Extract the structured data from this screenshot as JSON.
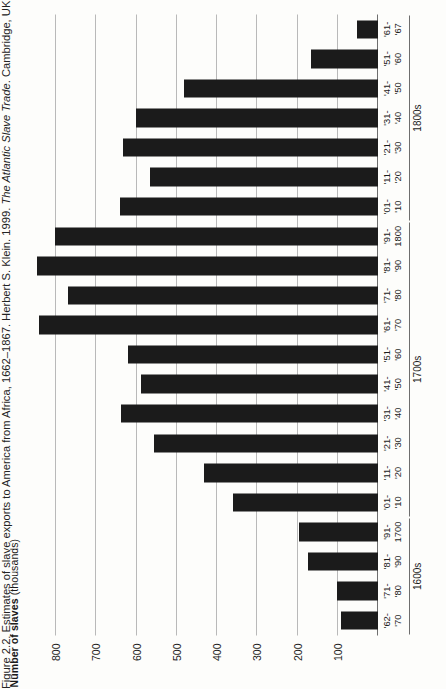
{
  "figure": {
    "caption_prefix": "Figure 2.2. Estimates of slave exports to America from Africa, 1662–1867. Herbert S. Klein. 1999. ",
    "caption_italic": "The Atlantic Slave Trade",
    "caption_suffix": ". Cambridge, UK:"
  },
  "axis_title": {
    "bold": "Number of slaves",
    "light": " (thousands)"
  },
  "groups": [
    {
      "label": "1600s",
      "start_index": 0,
      "end_index": 3
    },
    {
      "label": "1700s",
      "start_index": 4,
      "end_index": 13
    },
    {
      "label": "1800s",
      "start_index": 14,
      "end_index": 20
    }
  ],
  "chart_data": {
    "type": "bar",
    "orientation": "vertical-printed-rotated-90",
    "title": "",
    "xlabel": "",
    "ylabel": "Number of slaves (thousands)",
    "ylim": [
      0,
      850
    ],
    "yticks": [
      100,
      200,
      300,
      400,
      500,
      600,
      700,
      800
    ],
    "ytick_labels": [
      "100",
      "200",
      "300",
      "400",
      "500",
      "600",
      "700",
      "800"
    ],
    "grid": true,
    "legend": null,
    "bar_color": "#1b1b1b",
    "categories": [
      "'62-\n'70",
      "'71-\n'80",
      "'81-\n'90",
      "'91- 1700",
      "'01-\n'10",
      "'11-\n'20",
      "'21-\n'30",
      "'31-\n'40",
      "'41-\n'50",
      "'51-\n'60",
      "'61-\n'70",
      "'71-\n'80",
      "'81-\n'90",
      "'91- 1800",
      "'01-\n'10",
      "'11-\n'20",
      "'21-\n'30",
      "'31-\n'40",
      "'41-\n'50",
      "'51-\n'60",
      "'61-\n'67"
    ],
    "category_lines": [
      [
        "'62-",
        "'70"
      ],
      [
        "'71-",
        "'80"
      ],
      [
        "'81-",
        "'90"
      ],
      [
        "'91-",
        "1700"
      ],
      [
        "'01-",
        "'10"
      ],
      [
        "'11-",
        "'20"
      ],
      [
        "'21-",
        "'30"
      ],
      [
        "'31-",
        "'40"
      ],
      [
        "'41-",
        "'50"
      ],
      [
        "'51-",
        "'60"
      ],
      [
        "'61-",
        "'70"
      ],
      [
        "'71-",
        "'80"
      ],
      [
        "'81-",
        "'90"
      ],
      [
        "'91-",
        "1800"
      ],
      [
        "'01-",
        "'10"
      ],
      [
        "'11-",
        "'20"
      ],
      [
        "'21-",
        "'30"
      ],
      [
        "'31-",
        "'40"
      ],
      [
        "'41-",
        "'50"
      ],
      [
        "'51-",
        "'60"
      ],
      [
        "'61-",
        "'67"
      ]
    ],
    "values": [
      92,
      102,
      175,
      196,
      361,
      432,
      556,
      640,
      589,
      622,
      843,
      771,
      848,
      804,
      642,
      567,
      633,
      602,
      483,
      167,
      53
    ]
  }
}
